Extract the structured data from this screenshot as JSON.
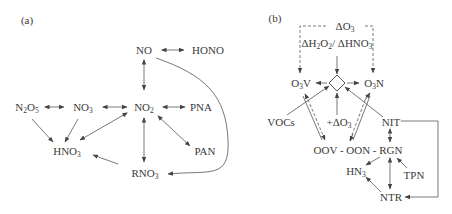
{
  "panel_a": {
    "tag": "(a)",
    "nodes": {
      "NO": {
        "text": "NO"
      },
      "HONO": {
        "text": "HONO"
      },
      "N2O5": {
        "main": "N",
        "sub1": "2",
        "mid": "O",
        "sub2": "5"
      },
      "NO3": {
        "main": "NO",
        "sub": "3"
      },
      "NO2": {
        "main": "NO",
        "sub": "2"
      },
      "PNA": {
        "text": "PNA"
      },
      "HNO3": {
        "main": "HNO",
        "sub": "3"
      },
      "PAN": {
        "text": "PAN"
      },
      "RNO3": {
        "main": "RNO",
        "sub": "3"
      }
    },
    "edges": [
      {
        "from": "NO",
        "to": "HONO",
        "type": "bidirectional"
      },
      {
        "from": "NO",
        "to": "NO2",
        "type": "bidirectional"
      },
      {
        "from": "N2O5",
        "to": "NO3",
        "type": "bidirectional"
      },
      {
        "from": "NO3",
        "to": "NO2",
        "type": "bidirectional"
      },
      {
        "from": "NO2",
        "to": "PNA",
        "type": "bidirectional"
      },
      {
        "from": "N2O5",
        "to": "HNO3",
        "type": "directed"
      },
      {
        "from": "NO3",
        "to": "HNO3",
        "type": "directed"
      },
      {
        "from": "NO2",
        "to": "HNO3",
        "type": "bidirectional"
      },
      {
        "from": "NO2",
        "to": "PAN",
        "type": "bidirectional"
      },
      {
        "from": "NO2",
        "to": "RNO3",
        "type": "bidirectional"
      },
      {
        "from": "RNO3",
        "to": "HNO3",
        "type": "directed"
      },
      {
        "from": "NO",
        "to": "RNO3",
        "type": "directed-curve"
      }
    ]
  },
  "panel_b": {
    "tag": "(b)",
    "nodes": {
      "dO3_top": {
        "prefix": "ΔO",
        "sub": "3"
      },
      "ratio": {
        "a": "ΔH",
        "s1": "2",
        "b": "O",
        "s2": "2",
        "c": "/ ΔHNO",
        "s3": "3"
      },
      "O3V": {
        "a": "O",
        "sub": "3",
        "b": "V"
      },
      "O3N": {
        "a": "O",
        "sub": "3",
        "b": "N"
      },
      "VOCs": {
        "text": "VOCs"
      },
      "plus_dO3": {
        "prefix": "+ΔO",
        "sub": "3"
      },
      "NIT": {
        "text": "NIT"
      },
      "OOV_OON_RGN": {
        "text": "OOV - OON - RGN"
      },
      "HN3": {
        "main": "HN",
        "sub": "3"
      },
      "TPN": {
        "text": "TPN"
      },
      "NTR": {
        "text": "NTR"
      }
    },
    "edges": [
      {
        "from": "dO3_top",
        "to": "O3V",
        "type": "dashed-directed"
      },
      {
        "from": "dO3_top",
        "to": "O3N",
        "type": "dashed-directed"
      },
      {
        "from": "ratio",
        "to": "diamond",
        "type": "directed"
      },
      {
        "from": "diamond",
        "to": "O3V",
        "type": "directed"
      },
      {
        "from": "diamond",
        "to": "O3N",
        "type": "directed"
      },
      {
        "from": "VOCs",
        "to": "diamond",
        "type": "directed"
      },
      {
        "from": "plus_dO3",
        "to": "diamond",
        "type": "directed"
      },
      {
        "from": "NIT",
        "to": "diamond",
        "type": "directed"
      },
      {
        "from": "O3V",
        "to": "OOV",
        "type": "double-dashed"
      },
      {
        "from": "O3N",
        "to": "OON",
        "type": "double-dashed"
      },
      {
        "from": "NIT",
        "to": "RGN",
        "type": "bidirectional"
      },
      {
        "from": "RGN",
        "to": "HN3",
        "type": "directed"
      },
      {
        "from": "TPN",
        "to": "RGN",
        "type": "directed"
      },
      {
        "from": "RGN",
        "to": "NTR",
        "type": "bidirectional"
      },
      {
        "from": "NTR",
        "to": "HN3",
        "type": "directed"
      },
      {
        "from": "NIT",
        "to": "NTR",
        "type": "elbow-directed"
      }
    ]
  }
}
